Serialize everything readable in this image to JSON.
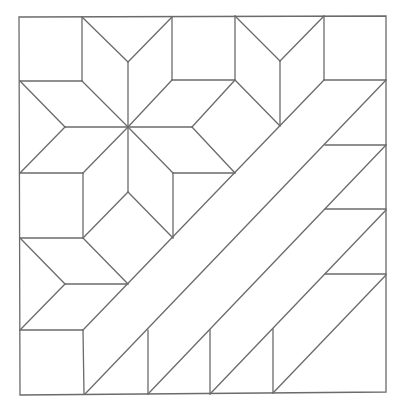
{
  "diagram": {
    "title": "Quilt block pattern: eight-pointed star with diagonal strips",
    "canvas": {
      "width": 402,
      "height": 410
    },
    "stroke_color": "#6b6b6b",
    "background": "#ffffff",
    "border": [
      [
        19,
        17
      ],
      [
        386,
        16
      ],
      [
        386,
        392
      ],
      [
        20,
        395
      ]
    ],
    "lines": [
      [
        82,
        17,
        128,
        62
      ],
      [
        172,
        17,
        128,
        62
      ],
      [
        82,
        17,
        82,
        81
      ],
      [
        172,
        17,
        172,
        80
      ],
      [
        128,
        62,
        128,
        127
      ],
      [
        20,
        81,
        82,
        81
      ],
      [
        82,
        81,
        128,
        127
      ],
      [
        172,
        80,
        128,
        127
      ],
      [
        172,
        80,
        235,
        80
      ],
      [
        20,
        81,
        65,
        127
      ],
      [
        65,
        127,
        20,
        173
      ],
      [
        65,
        127,
        128,
        127
      ],
      [
        20,
        173,
        83,
        173
      ],
      [
        83,
        173,
        128,
        127
      ],
      [
        83,
        173,
        83,
        238
      ],
      [
        128,
        127,
        128,
        192
      ],
      [
        128,
        192,
        83,
        238
      ],
      [
        128,
        192,
        173,
        238
      ],
      [
        128,
        127,
        173,
        173
      ],
      [
        173,
        173,
        235,
        173
      ],
      [
        173,
        173,
        173,
        238
      ],
      [
        128,
        127,
        192,
        127
      ],
      [
        192,
        127,
        235,
        80
      ],
      [
        192,
        127,
        235,
        173
      ],
      [
        235,
        80,
        280,
        126
      ],
      [
        235,
        16,
        235,
        80
      ],
      [
        235,
        16,
        280,
        61
      ],
      [
        324,
        16,
        280,
        61
      ],
      [
        280,
        61,
        280,
        126
      ],
      [
        324,
        16,
        324,
        80
      ],
      [
        324,
        80,
        386,
        80
      ],
      [
        20,
        238,
        83,
        238
      ],
      [
        20,
        238,
        65,
        284
      ],
      [
        65,
        284,
        128,
        284
      ],
      [
        65,
        284,
        20,
        330
      ],
      [
        20,
        330,
        83,
        330
      ],
      [
        83,
        238,
        128,
        284
      ],
      [
        83,
        330,
        84,
        394
      ],
      [
        83,
        330,
        324,
        80
      ],
      [
        85,
        394,
        386,
        80
      ],
      [
        148,
        394,
        386,
        145
      ],
      [
        210,
        394,
        386,
        210
      ],
      [
        273,
        393,
        386,
        275
      ],
      [
        148,
        330,
        148,
        394
      ],
      [
        210,
        330,
        210,
        394
      ],
      [
        273,
        329,
        273,
        393
      ],
      [
        325,
        145,
        386,
        145
      ],
      [
        325,
        209,
        386,
        209
      ],
      [
        325,
        274,
        386,
        274
      ]
    ]
  }
}
